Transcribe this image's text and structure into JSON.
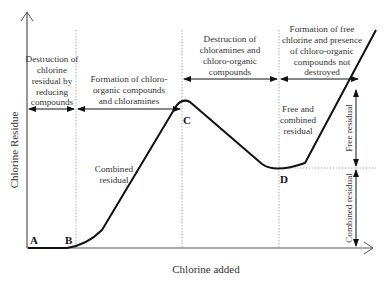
{
  "diagram": {
    "y_axis_label": "Chlorine Residue",
    "x_axis_label": "Chlorine added",
    "points": {
      "A": "A",
      "B": "B",
      "C": "C",
      "D": "D"
    },
    "phases": [
      {
        "lines": [
          "Destruction of",
          "chlorine",
          "residual by",
          "reducing",
          "compounds"
        ]
      },
      {
        "lines": [
          "Formation of chloro-",
          "organic compounds",
          "and chloramines"
        ]
      },
      {
        "lines": [
          "Destruction of",
          "chloramines and",
          "chloro-organic",
          "compounds"
        ]
      },
      {
        "lines": [
          "Formation of free",
          "chlorine and presence",
          "of chloro-organic",
          "compounds not",
          "destroyed"
        ]
      }
    ],
    "curve_annotations": {
      "combined_residual": [
        "Combined",
        "residual"
      ],
      "free_and_combined": [
        "Free and",
        "combined",
        "residual"
      ]
    },
    "right_side_labels": {
      "free_residual": "Free residual",
      "combined_residual": "Combined residual"
    },
    "colors": {
      "curve": "#111111",
      "axis": "#555555",
      "guide": "#9a9a9a",
      "text": "#333333"
    }
  }
}
